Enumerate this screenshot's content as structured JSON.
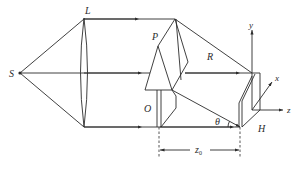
{
  "figure": {
    "labels": {
      "source": "S",
      "lens": "L",
      "prism": "P",
      "reference_beam": "R",
      "object": "O",
      "hologram": "H",
      "angle": "θ",
      "distance": "z",
      "distance_sub": "0",
      "axis_x": "x",
      "axis_y": "y",
      "axis_z": "z"
    },
    "colors": {
      "line": "#2b2b2b",
      "background": "#ffffff"
    }
  }
}
